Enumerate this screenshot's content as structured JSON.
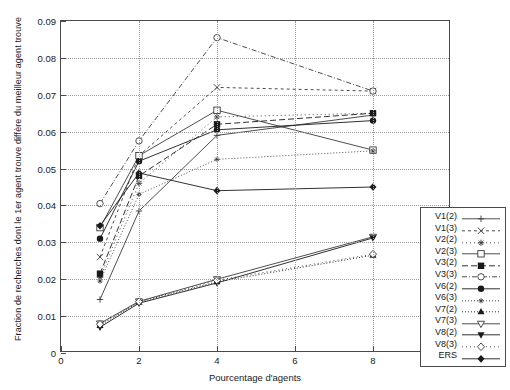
{
  "chart_data": {
    "type": "line",
    "title": "",
    "xlabel": "Pourcentage d'agents",
    "ylabel": "Fraction de recherches dont le 1er agent trouve diffère du meilleur agent trouve",
    "xlim": [
      0,
      10
    ],
    "ylim": [
      0,
      0.09
    ],
    "xticks": [
      "0",
      "2",
      "4",
      "6",
      "8",
      "10"
    ],
    "xtick_values": [
      0,
      2,
      4,
      6,
      8,
      10
    ],
    "yticks": [
      "0",
      "0.01",
      "0.02",
      "0.03",
      "0.04",
      "0.05",
      "0.06",
      "0.07",
      "0.08",
      "0.09"
    ],
    "ytick_values": [
      0,
      0.01,
      0.02,
      0.03,
      0.04,
      0.05,
      0.06,
      0.07,
      0.08,
      0.09
    ],
    "grid": true,
    "grid_style": "dotted",
    "legend_position": "right-inside-bottom",
    "x": [
      1,
      2,
      4,
      8
    ],
    "series": [
      {
        "name": "V1(2)",
        "marker": "plus",
        "dash": "none",
        "color": "#3a3a3a",
        "values": [
          0.0145,
          0.0385,
          0.059,
          0.0645
        ]
      },
      {
        "name": "V1(3)",
        "marker": "cross",
        "dash": "3,3",
        "color": "#3a3a3a",
        "values": [
          0.026,
          0.0535,
          0.072,
          0.071
        ]
      },
      {
        "name": "V2(2)",
        "marker": "star",
        "dash": "1,3",
        "color": "#3a3a3a",
        "values": [
          0.0205,
          0.046,
          0.064,
          0.065
        ]
      },
      {
        "name": "V2(3)",
        "marker": "open-square",
        "dash": "none",
        "color": "#3a3a3a",
        "values": [
          0.034,
          0.0535,
          0.0658,
          0.055
        ]
      },
      {
        "name": "V3(2)",
        "marker": "filled-square",
        "dash": "6,3",
        "color": "#1a1a1a",
        "values": [
          0.0215,
          0.048,
          0.062,
          0.065
        ]
      },
      {
        "name": "V3(3)",
        "marker": "open-circle",
        "dash": "5,2,1,2",
        "color": "#3a3a3a",
        "values": [
          0.0405,
          0.0575,
          0.0855,
          0.071
        ]
      },
      {
        "name": "V6(2)",
        "marker": "filled-circle",
        "dash": "none",
        "color": "#1a1a1a",
        "values": [
          0.031,
          0.052,
          0.0605,
          0.063
        ]
      },
      {
        "name": "V6(3)",
        "marker": "small-star",
        "dash": "1,2",
        "color": "#3a3a3a",
        "values": [
          0.0195,
          0.043,
          0.0525,
          0.0548
        ]
      },
      {
        "name": "V7(2)",
        "marker": "filled-tri-up",
        "dash": "1,2",
        "color": "#1a1a1a",
        "values": [
          0.0075,
          0.0138,
          0.0193,
          0.0265
        ]
      },
      {
        "name": "V7(3)",
        "marker": "open-tri-down",
        "dash": "none",
        "color": "#3a3a3a",
        "values": [
          0.008,
          0.014,
          0.02,
          0.0315
        ]
      },
      {
        "name": "V8(2)",
        "marker": "filled-tri-dn",
        "dash": "none",
        "color": "#1a1a1a",
        "values": [
          0.007,
          0.0135,
          0.019,
          0.0312
        ]
      },
      {
        "name": "V8(3)",
        "marker": "open-diamond",
        "dash": "1,3",
        "color": "#3a3a3a",
        "values": [
          0.0078,
          0.0139,
          0.0197,
          0.0268
        ]
      },
      {
        "name": "ERS",
        "marker": "filled-diamond",
        "dash": "none",
        "color": "#1a1a1a",
        "values": [
          0.0345,
          0.0488,
          0.044,
          0.045
        ]
      }
    ]
  }
}
